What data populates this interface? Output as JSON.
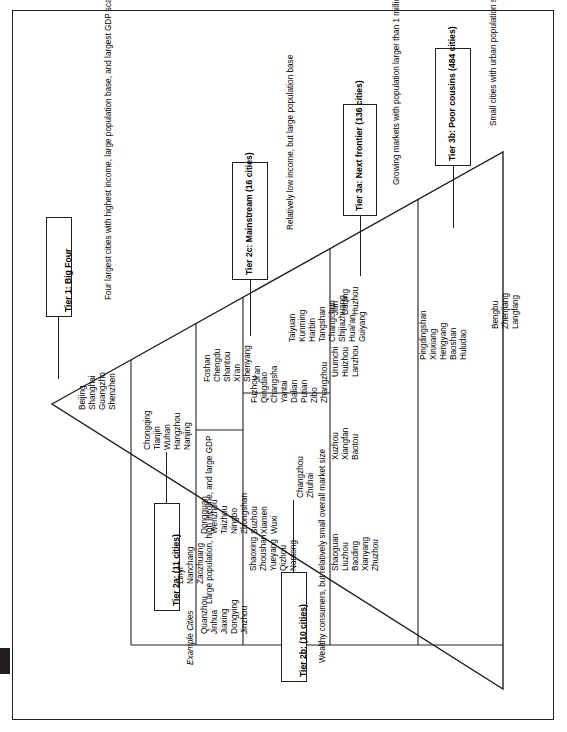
{
  "diagram": {
    "example_cities_caption": "Example Cities",
    "tiers": [
      {
        "id": "tier1",
        "label": "Tier 1: Big Four",
        "description": "Four largest cities with highest income, large population base, and largest GDP scale",
        "cities": [
          "Beijing",
          "Shanghai",
          "Guangzho",
          "Shenzhen"
        ]
      },
      {
        "id": "tier2a",
        "label": "Tier 2a: (11 cities)",
        "description": "Large population, high income, and large GDP",
        "cities_col_a": [
          "Chongqing",
          "Tianjin",
          "Wuhan",
          "Hangzhou",
          "Nanjing"
        ],
        "cities_col_b": [
          "Foshan",
          "Chengdu",
          "Shantou",
          "Xi'an",
          "Shenyang",
          "Ji'an"
        ]
      },
      {
        "id": "tier2b",
        "label": "Tier 2b: (10 cities)",
        "description": "Wealthy consumers, but relatively small overall market size",
        "cities_col_a": [
          "Dongguan",
          "Wenzhou",
          "Taizhou",
          "Ningbo",
          "Zhongshan",
          "Suzhou",
          "Xiamen",
          "Wuxi"
        ],
        "cities_col_b": [
          "Changzhou",
          "Zhuhai"
        ]
      },
      {
        "id": "tier2c",
        "label": "Tier 2c: Mainstream (16 cities)",
        "description": "Relatively low income, but large population base",
        "cities_col_a": [
          "Fuzhou",
          "Qingdao",
          "Changsha",
          "Yantai",
          "Dalian",
          "Putian",
          "Zibo",
          "Zhangzhou"
        ],
        "cities_col_b": [
          "Taiyuan",
          "Kunming",
          "Harbin",
          "Tangshan",
          "Changchun",
          "Shijiazhuang",
          "Huai'an",
          "Guiyang"
        ]
      },
      {
        "id": "tier3a",
        "label": "Tier 3a: Next frontier (136 cities)",
        "description": "Growing markets with population larger than 1 million",
        "cities_col_a": [
          "Xuzhou",
          "Xiangfan",
          "Baotou"
        ],
        "cities_col_b": [
          "Urumchi",
          "Huizhou",
          "Lanzhou"
        ],
        "cities_col_c": [
          "Jilin",
          "Daqing",
          "Huzhou"
        ]
      },
      {
        "id": "tier3b",
        "label": "Tier 3b: Poor cousins (484 cities)",
        "description": "Small cities with urban population smaller than 1 million",
        "cities_col_a": [
          "Linyi",
          "Nanchang",
          "Zaozhuang"
        ],
        "cities_col_b": [
          "Shaoxing",
          "Zhoushan",
          "Yueyang",
          "Qizhou",
          "Nantong"
        ],
        "cities_col_c": [
          "Shaoguan",
          "Liuzhou",
          "Baoding",
          "Xianyang",
          "Zhuzhou"
        ],
        "cities_col_d": [
          "Pingdingshan",
          "Xinxiang",
          "Hengyang",
          "Baoshan",
          "Huludao"
        ],
        "cities_col_e": [
          "Bengbu",
          "Zhenjiang",
          "Langfang"
        ],
        "cities_col_f": [
          "Quanzhou",
          "Jinhua",
          "Jiaxing",
          "Dongying",
          "Jinzhou"
        ]
      }
    ]
  }
}
